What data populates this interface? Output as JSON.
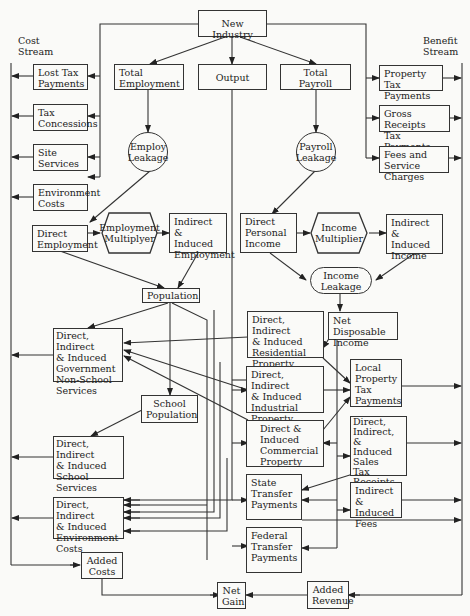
{
  "stream_labels": {
    "cost": "Cost\nStream",
    "benefit": "Benefit\nStream"
  },
  "nodes": {
    "new_industry": "New Industry",
    "total_employment": "Total\nEmployment",
    "output": "Output",
    "total_payroll": "Total\nPayroll",
    "lost_tax_payments": "Lost Tax\nPayments",
    "tax_concessions": "Tax\nConcessions",
    "site_services": "Site\nServices",
    "environment_costs": "Environment\nCosts",
    "property_tax_payments": "Property\nTax Payments",
    "gross_receipts": "Gross Receipts\nTax Payments",
    "fees_service": "Fees and\nService Charges",
    "employ_leakage": "Employ\nLeakage",
    "payroll_leakage": "Payroll\nLeakage",
    "direct_employment": "Direct\nEmployment",
    "employment_multiplyer": "Employment\nMultiplyer",
    "indirect_employment": "Indirect &\nInduced\nEmployment",
    "direct_personal_income": "Direct\nPersonal\nIncome",
    "income_multiplier": "Income\nMultiplier",
    "indirect_income": "Indirect &\nInduced\nIncome",
    "income_leakage": "Income\nLeakage",
    "population": "Population",
    "net_disposable_income": "Net Disposable\nIncome",
    "gov_non_school": "Direct, Indirect\n& Induced\nGovernment\nNon-School\nServices",
    "residential_property": "Direct, Indirect\n& Induced\nResidential\nProperty",
    "industrial_property": "Direct, Indirect\n& Induced\nIndustrial\nProperty",
    "commercial_property": "Direct &\nInduced\nCommercial\nProperty",
    "local_property_tax": "Local\nProperty\nTax\nPayments",
    "school_population": "School\nPopulation",
    "school_services": "Direct, Indirect\n& Induced\nSchool\nServices",
    "sales_tax": "Direct,\nIndirect, &\nInduced\nSales\nTax\nReceipts",
    "state_transfer": "State\nTransfer\nPayments",
    "indirect_fees": "Indirect &\nInduced\nFees",
    "environment_costs_2": "Direct, Indirect\n& Induced\nEnvironment\nCosts",
    "federal_transfer": "Federal\nTransfer\nPayments",
    "added_costs": "Added\nCosts",
    "net_gain": "Net\nGain",
    "added_revenue": "Added\nRevenue"
  }
}
